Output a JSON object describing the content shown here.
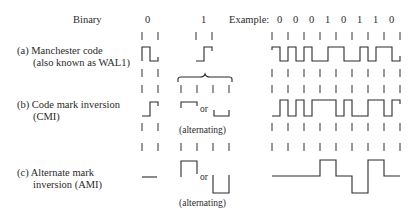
{
  "header": {
    "binary_label": "Binary",
    "bit_zero": "0",
    "bit_one": "1",
    "example_label": "Example:",
    "example_bits": [
      "0",
      "0",
      "0",
      "1",
      "0",
      "1",
      "1",
      "0"
    ]
  },
  "rows": [
    {
      "id": "a",
      "label_line1": "(a)  Manchester code",
      "label_line2": "(also known as WAL1)"
    },
    {
      "id": "b",
      "label_line1": "(b)  Code mark inversion",
      "label_line2": "(CMI)",
      "or_text": "or",
      "alternating_text": "(alternating)"
    },
    {
      "id": "c",
      "label_line1": "(c)  Alternate mark",
      "label_line2": "inversion (AMI)",
      "or_text": "or",
      "alternating_text": "(alternating)"
    }
  ]
}
